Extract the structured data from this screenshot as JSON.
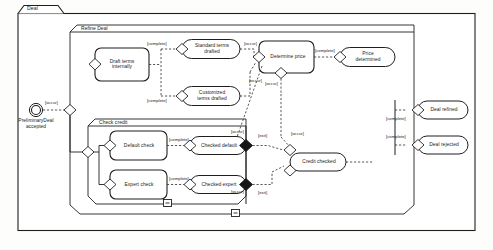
{
  "diagram": {
    "frame_title": "Deal",
    "regions": [
      {
        "id": "refine-deal",
        "title": "Refine Deal"
      },
      {
        "id": "check-credit",
        "title": "Check credit"
      }
    ],
    "nodes": [
      {
        "id": "preliminary-deal-accepted",
        "label": "PreliminaryDeal\naccepted",
        "type": "entry-point"
      },
      {
        "id": "draft-terms-internally",
        "label": "Draft terms\ninternally",
        "type": "action"
      },
      {
        "id": "standard-terms-drafted",
        "label": "Standard terms\ndrafted",
        "type": "state"
      },
      {
        "id": "customized-terms-drafted",
        "label": "Customized\nterms drafted",
        "type": "state"
      },
      {
        "id": "determine-price",
        "label": "Determine price",
        "type": "action"
      },
      {
        "id": "price-determined",
        "label": "Price\ndetermined",
        "type": "state"
      },
      {
        "id": "default-check",
        "label": "Default check",
        "type": "action"
      },
      {
        "id": "checked-default",
        "label": "Checked default",
        "type": "state"
      },
      {
        "id": "expert-check",
        "label": "Expert check",
        "type": "action"
      },
      {
        "id": "checked-expert",
        "label": "Checked expert",
        "type": "state"
      },
      {
        "id": "credit-checked",
        "label": "Credit checked",
        "type": "state"
      },
      {
        "id": "deal-refined",
        "label": "Deal refined",
        "type": "state"
      },
      {
        "id": "deal-rejected",
        "label": "Deal rejected",
        "type": "state"
      }
    ],
    "guards": [
      {
        "id": "guard-occur-entry",
        "label": "[occur]"
      },
      {
        "id": "guard-complete-standard",
        "label": "[complete]"
      },
      {
        "id": "guard-complete-customized",
        "label": "[complete]"
      },
      {
        "id": "guard-occur-standard",
        "label": "[occur]"
      },
      {
        "id": "guard-occur-customized",
        "label": "[occur]"
      },
      {
        "id": "guard-complete-price",
        "label": "[complete]"
      },
      {
        "id": "guard-occur-price",
        "label": "[occur]"
      },
      {
        "id": "guard-complete-default",
        "label": "[complete]"
      },
      {
        "id": "guard-complete-expert",
        "label": "[complete]"
      },
      {
        "id": "guard-occur-default",
        "label": "[occur]"
      },
      {
        "id": "guard-occur-expert",
        "label": "[occur]"
      },
      {
        "id": "guard-exit-credit",
        "label": "[exit]"
      },
      {
        "id": "guard-exit-lower",
        "label": "[exit]"
      },
      {
        "id": "guard-occur-credit",
        "label": "[occur]"
      },
      {
        "id": "guard-complete-refined",
        "label": "[complete]"
      },
      {
        "id": "guard-complete-rejected",
        "label": "[complete]"
      }
    ],
    "controls": [
      {
        "id": "collapse-check-credit",
        "label": "-"
      },
      {
        "id": "collapse-refine-deal",
        "label": "-"
      }
    ],
    "colors": {
      "stroke": "#1f1f1f",
      "dashed": "#3a3a3a",
      "fill": "#ffffff",
      "join": "#161616",
      "background": "#fdfdfc"
    }
  }
}
